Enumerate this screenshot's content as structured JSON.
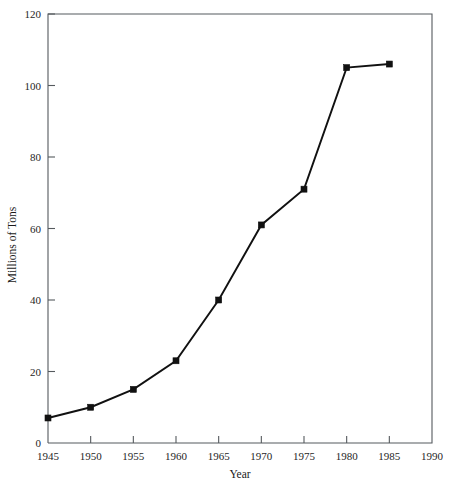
{
  "chart_data": {
    "type": "line",
    "title": "",
    "xlabel": "Year",
    "ylabel": "Millions of Tons",
    "x": [
      1945,
      1950,
      1955,
      1960,
      1965,
      1970,
      1975,
      1980,
      1985
    ],
    "values": [
      7,
      10,
      15,
      23,
      40,
      61,
      71,
      105,
      106
    ],
    "xlim": [
      1945,
      1990
    ],
    "ylim": [
      0,
      120
    ],
    "xticks": [
      1945,
      1950,
      1955,
      1960,
      1965,
      1970,
      1975,
      1980,
      1985,
      1990
    ],
    "xtick_labels": [
      "1945",
      "1950",
      "1955",
      "1960",
      "1965",
      "1970",
      "1975",
      "1980",
      "1985",
      "1990"
    ],
    "yticks": [
      0,
      20,
      40,
      60,
      80,
      100,
      120
    ],
    "ytick_labels": [
      "0",
      "20",
      "40",
      "60",
      "80",
      "100",
      "120"
    ],
    "grid": false,
    "legend": null,
    "marker": "square",
    "series_color": "#111111",
    "axis_color": "#555a5e",
    "background_color": "#ffffff"
  }
}
